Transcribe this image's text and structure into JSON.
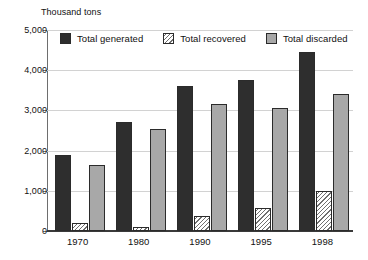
{
  "clipped_title": "Passenger cars, trucks, and motorcycles",
  "units_label": "Thousand tons",
  "legend": {
    "items": [
      {
        "label": "Total generated",
        "swatch": "solid-dark-square-icon",
        "color": "#2e2e2e"
      },
      {
        "label": "Total recovered",
        "swatch": "hatched-white-square-icon",
        "color": "#ffffff"
      },
      {
        "label": "Total discarded",
        "swatch": "solid-gray-square-icon",
        "color": "#a8a8a8"
      }
    ]
  },
  "chart_data": {
    "type": "bar",
    "subtitle": "Thousand tons",
    "xlabel": "",
    "ylabel": "Thousand tons",
    "ylim": [
      0,
      5000
    ],
    "yticks": [
      0,
      1000,
      2000,
      3000,
      4000,
      5000
    ],
    "ytick_labels": [
      "0",
      "1,000",
      "2,000",
      "3,000",
      "4,000",
      "5,000"
    ],
    "grid": true,
    "legend_position": "top-inside",
    "categories": [
      "1970",
      "1980",
      "1990",
      "1995",
      "1998"
    ],
    "series": [
      {
        "name": "Total generated",
        "color": "#2e2e2e",
        "values": [
          1900,
          2700,
          3600,
          3750,
          4450
        ]
      },
      {
        "name": "Total recovered",
        "color": "#ffffff",
        "values": [
          200,
          100,
          380,
          570,
          1000
        ]
      },
      {
        "name": "Total discarded",
        "color": "#a8a8a8",
        "values": [
          1650,
          2550,
          3150,
          3050,
          3400
        ]
      }
    ]
  }
}
